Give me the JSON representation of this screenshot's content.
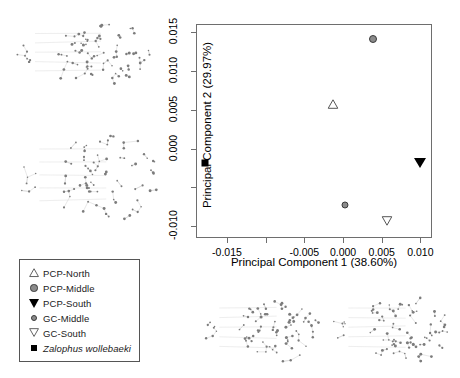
{
  "chart_data": {
    "type": "scatter",
    "title": "",
    "xlabel": "Principal Component 1 (38.60%)",
    "ylabel": "Principal Component 2 (29.97%)",
    "xlim": [
      -0.019,
      0.0115
    ],
    "ylim": [
      -0.0115,
      0.016
    ],
    "xticks": [
      -0.015,
      -0.01,
      -0.005,
      0.0,
      0.005,
      0.01
    ],
    "xticklabels": [
      "-0.015",
      "",
      "-0.005",
      "0.000",
      "0.005",
      "0.010"
    ],
    "yticks": [
      -0.01,
      -0.005,
      0.0,
      0.005,
      0.01,
      0.015
    ],
    "yticklabels": [
      "-0.010",
      "",
      "0.000",
      "0.005",
      "0.010",
      "0.015"
    ],
    "grid": false,
    "legend_position": "outside-lower-left",
    "points": [
      {
        "label": "PCP-North",
        "x": -0.0013,
        "y": 0.0057,
        "marker": "triangle-up-open",
        "color": "#555555"
      },
      {
        "label": "PCP-Middle",
        "x": 0.0039,
        "y": 0.0141,
        "marker": "circle-filled-gray",
        "color": "#8b8b8b"
      },
      {
        "label": "PCP-South",
        "x": 0.01,
        "y": -0.0018,
        "marker": "triangle-down-filled",
        "color": "#000000"
      },
      {
        "label": "GC-Middle",
        "x": 0.0002,
        "y": -0.0072,
        "marker": "circle-filled-gray",
        "color": "#8b8b8b"
      },
      {
        "label": "GC-South",
        "x": 0.0057,
        "y": -0.0093,
        "marker": "triangle-down-open",
        "color": "#555555"
      },
      {
        "label": "Zalophus wollebaeki",
        "x": -0.0178,
        "y": -0.0018,
        "marker": "square-filled",
        "color": "#000000"
      }
    ]
  },
  "legend": {
    "items": [
      {
        "label": "PCP-North",
        "marker": "triangle-up-open",
        "italic": false
      },
      {
        "label": "PCP-Middle",
        "marker": "circle-filled-gray",
        "italic": false
      },
      {
        "label": "PCP-South",
        "marker": "triangle-down-filled",
        "italic": false
      },
      {
        "label": "GC-Middle",
        "marker": "circle-filled-gray",
        "italic": false
      },
      {
        "label": "GC-South",
        "marker": "triangle-down-open",
        "italic": false
      },
      {
        "label": "Zalophus wollebaeki",
        "marker": "square-filled",
        "italic": true
      }
    ]
  },
  "networks": [
    {
      "name": "haplotype-network-top-left"
    },
    {
      "name": "haplotype-network-middle-left"
    },
    {
      "name": "haplotype-network-bottom-center"
    },
    {
      "name": "haplotype-network-bottom-right"
    }
  ]
}
